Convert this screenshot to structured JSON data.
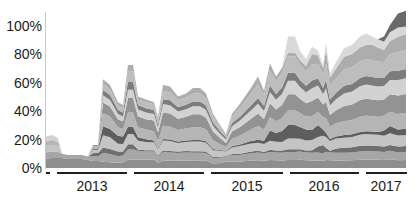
{
  "chart_data": {
    "type": "area",
    "stacked": true,
    "title": "",
    "xlabel": "",
    "ylabel": "",
    "ylim": [
      0,
      110
    ],
    "grid": false,
    "legend": null,
    "y_ticks": [
      "0%",
      "20%",
      "40%",
      "60%",
      "80%",
      "100%"
    ],
    "y_tick_values": [
      0,
      20,
      40,
      60,
      80,
      100
    ],
    "x_groups": [
      {
        "label": "",
        "x_start": 46,
        "x_end": 50
      },
      {
        "label": "2013",
        "x_start": 57,
        "x_end": 127
      },
      {
        "label": "2014",
        "x_start": 134,
        "x_end": 204
      },
      {
        "label": "2015",
        "x_start": 211,
        "x_end": 283
      },
      {
        "label": "2016",
        "x_start": 290,
        "x_end": 359
      },
      {
        "label": "2017",
        "x_start": 366,
        "x_end": 407
      }
    ],
    "x_pixels": [
      46,
      52,
      58,
      62,
      68,
      75,
      82,
      88,
      93,
      98,
      103,
      110,
      118,
      123,
      128,
      133,
      138,
      146,
      154,
      158,
      163,
      170,
      178,
      186,
      193,
      200,
      206,
      213,
      220,
      226,
      232,
      240,
      250,
      258,
      264,
      270,
      276,
      282,
      288,
      295,
      300,
      306,
      312,
      318,
      323,
      326,
      330,
      336,
      344,
      352,
      360,
      366,
      372,
      378,
      384,
      390,
      398,
      406
    ],
    "total": [
      22,
      23,
      21,
      10,
      9,
      9,
      9,
      8,
      16,
      16,
      62,
      58,
      46,
      44,
      72,
      72,
      50,
      48,
      46,
      36,
      58,
      57,
      50,
      52,
      56,
      56,
      52,
      38,
      30,
      24,
      38,
      45,
      55,
      64,
      54,
      73,
      64,
      70,
      92,
      92,
      82,
      76,
      85,
      82,
      72,
      88,
      66,
      74,
      84,
      86,
      92,
      94,
      92,
      90,
      92,
      100,
      108,
      110
    ],
    "series": [
      {
        "name": "layer-1",
        "color": "#8e8e8e",
        "share": [
          0.3,
          0.3,
          0.33,
          0.7,
          0.7,
          0.7,
          0.7,
          0.7,
          0.3,
          0.3,
          0.07,
          0.07,
          0.08,
          0.09,
          0.08,
          0.08,
          0.12,
          0.12,
          0.13,
          0.1,
          0.09,
          0.09,
          0.1,
          0.1,
          0.09,
          0.09,
          0.1,
          0.08,
          0.12,
          0.2,
          0.12,
          0.1,
          0.09,
          0.08,
          0.09,
          0.07,
          0.08,
          0.07,
          0.06,
          0.06,
          0.07,
          0.07,
          0.06,
          0.06,
          0.07,
          0.06,
          0.08,
          0.07,
          0.06,
          0.06,
          0.06,
          0.06,
          0.06,
          0.06,
          0.06,
          0.06,
          0.05,
          0.05
        ]
      },
      {
        "name": "layer-2",
        "color": "#a6a6a6",
        "share": [
          0.2,
          0.2,
          0.2,
          0.3,
          0.3,
          0.3,
          0.3,
          0.3,
          0.2,
          0.2,
          0.1,
          0.1,
          0.1,
          0.11,
          0.1,
          0.1,
          0.12,
          0.12,
          0.12,
          0.12,
          0.1,
          0.1,
          0.11,
          0.11,
          0.1,
          0.1,
          0.1,
          0.1,
          0.12,
          0.14,
          0.12,
          0.1,
          0.09,
          0.08,
          0.09,
          0.07,
          0.08,
          0.07,
          0.06,
          0.06,
          0.07,
          0.07,
          0.06,
          0.07,
          0.07,
          0.06,
          0.08,
          0.07,
          0.06,
          0.06,
          0.06,
          0.06,
          0.06,
          0.06,
          0.06,
          0.06,
          0.05,
          0.05
        ]
      },
      {
        "name": "layer-3",
        "color": "#6f6f6f",
        "share": [
          0,
          0,
          0,
          0,
          0,
          0,
          0,
          0,
          0.15,
          0.15,
          0.06,
          0.06,
          0.07,
          0.06,
          0.05,
          0.05,
          0.02,
          0.02,
          0.02,
          0.02,
          0.02,
          0.02,
          0.02,
          0.02,
          0.02,
          0.02,
          0.02,
          0.02,
          0.02,
          0.02,
          0.02,
          0.02,
          0.02,
          0.02,
          0.02,
          0.02,
          0.02,
          0.02,
          0.02,
          0.02,
          0.02,
          0.02,
          0.02,
          0.05,
          0.08,
          0.03,
          0.02,
          0.04,
          0.04,
          0.04,
          0.04,
          0.04,
          0.04,
          0.04,
          0.04,
          0.04,
          0.04,
          0.04
        ]
      },
      {
        "name": "layer-4",
        "color": "#c4c4c4",
        "share": [
          0.2,
          0.2,
          0.2,
          0,
          0,
          0,
          0,
          0,
          0.15,
          0.15,
          0.14,
          0.14,
          0.12,
          0.12,
          0.1,
          0.1,
          0.12,
          0.12,
          0.12,
          0.12,
          0.12,
          0.12,
          0.12,
          0.12,
          0.12,
          0.12,
          0.12,
          0.12,
          0.14,
          0.14,
          0.12,
          0.12,
          0.1,
          0.08,
          0.1,
          0.08,
          0.09,
          0.08,
          0.08,
          0.08,
          0.09,
          0.09,
          0.08,
          0.08,
          0.09,
          0.08,
          0.1,
          0.09,
          0.08,
          0.08,
          0.08,
          0.08,
          0.08,
          0.08,
          0.08,
          0.08,
          0.07,
          0.07
        ]
      },
      {
        "name": "layer-5",
        "color": "#5e5e5e",
        "share": [
          0,
          0,
          0,
          0,
          0,
          0,
          0,
          0,
          0.05,
          0.05,
          0.1,
          0.1,
          0.12,
          0.12,
          0.07,
          0.07,
          0.05,
          0.04,
          0.03,
          0.02,
          0.02,
          0.02,
          0.02,
          0.02,
          0.02,
          0.02,
          0.02,
          0.02,
          0.02,
          0.02,
          0.02,
          0.02,
          0.03,
          0.03,
          0.04,
          0.09,
          0.09,
          0.1,
          0.1,
          0.1,
          0.1,
          0.1,
          0.08,
          0.1,
          0.06,
          0.03,
          0.02,
          0.02,
          0.02,
          0.02,
          0.02,
          0.02,
          0.02,
          0.02,
          0.04,
          0.05,
          0.04,
          0.04
        ]
      },
      {
        "name": "layer-6",
        "color": "#b5b5b5",
        "share": [
          0.15,
          0.15,
          0.14,
          0,
          0,
          0,
          0,
          0,
          0.1,
          0.1,
          0.15,
          0.15,
          0.13,
          0.12,
          0.14,
          0.14,
          0.14,
          0.14,
          0.14,
          0.14,
          0.16,
          0.16,
          0.16,
          0.16,
          0.16,
          0.16,
          0.16,
          0.16,
          0.14,
          0.12,
          0.14,
          0.14,
          0.14,
          0.14,
          0.14,
          0.12,
          0.12,
          0.12,
          0.11,
          0.11,
          0.12,
          0.12,
          0.11,
          0.11,
          0.12,
          0.11,
          0.13,
          0.12,
          0.11,
          0.11,
          0.11,
          0.11,
          0.11,
          0.11,
          0.11,
          0.1,
          0.1,
          0.1
        ]
      },
      {
        "name": "layer-7",
        "color": "#939393",
        "share": [
          0,
          0,
          0,
          0,
          0,
          0,
          0,
          0,
          0.05,
          0.05,
          0.12,
          0.12,
          0.12,
          0.12,
          0.14,
          0.14,
          0.15,
          0.15,
          0.16,
          0.16,
          0.16,
          0.16,
          0.16,
          0.16,
          0.16,
          0.16,
          0.16,
          0.16,
          0.14,
          0.12,
          0.13,
          0.13,
          0.13,
          0.13,
          0.13,
          0.12,
          0.12,
          0.12,
          0.12,
          0.12,
          0.12,
          0.12,
          0.12,
          0.12,
          0.12,
          0.12,
          0.12,
          0.12,
          0.12,
          0.12,
          0.12,
          0.12,
          0.12,
          0.12,
          0.12,
          0.12,
          0.12,
          0.12
        ]
      },
      {
        "name": "layer-8",
        "color": "#d2d2d2",
        "share": [
          0.15,
          0.15,
          0.13,
          0,
          0,
          0,
          0,
          0,
          0,
          0,
          0.08,
          0.08,
          0.08,
          0.08,
          0.08,
          0.08,
          0.1,
          0.1,
          0.1,
          0.1,
          0.1,
          0.1,
          0.1,
          0.1,
          0.1,
          0.1,
          0.1,
          0.1,
          0.1,
          0.1,
          0.1,
          0.1,
          0.1,
          0.1,
          0.1,
          0.1,
          0.1,
          0.1,
          0.1,
          0.1,
          0.1,
          0.1,
          0.1,
          0.1,
          0.1,
          0.1,
          0.1,
          0.1,
          0.1,
          0.1,
          0.1,
          0.1,
          0.1,
          0.1,
          0.1,
          0.1,
          0.1,
          0.1
        ]
      },
      {
        "name": "layer-9",
        "color": "#7c7c7c",
        "share": [
          0,
          0,
          0,
          0,
          0,
          0,
          0,
          0,
          0,
          0,
          0.06,
          0.06,
          0.06,
          0.06,
          0.08,
          0.08,
          0.06,
          0.06,
          0.06,
          0.06,
          0.06,
          0.06,
          0.06,
          0.06,
          0.06,
          0.06,
          0.06,
          0.06,
          0.06,
          0.06,
          0.06,
          0.06,
          0.06,
          0.06,
          0.06,
          0.06,
          0.06,
          0.06,
          0.06,
          0.06,
          0.06,
          0.06,
          0.06,
          0.06,
          0.06,
          0.06,
          0.06,
          0.06,
          0.06,
          0.06,
          0.06,
          0.06,
          0.06,
          0.06,
          0.06,
          0.06,
          0.06,
          0.06
        ]
      },
      {
        "name": "layer-10",
        "color": "#bdbdbd",
        "share": [
          0,
          0,
          0,
          0,
          0,
          0,
          0,
          0,
          0,
          0,
          0.07,
          0.07,
          0.07,
          0.07,
          0.1,
          0.1,
          0.08,
          0.09,
          0.09,
          0.12,
          0.1,
          0.1,
          0.1,
          0.1,
          0.1,
          0.1,
          0.1,
          0.12,
          0.1,
          0.1,
          0.12,
          0.14,
          0.14,
          0.14,
          0.13,
          0.13,
          0.13,
          0.13,
          0.12,
          0.12,
          0.13,
          0.13,
          0.13,
          0.12,
          0.13,
          0.12,
          0.14,
          0.13,
          0.13,
          0.13,
          0.12,
          0.12,
          0.12,
          0.12,
          0.12,
          0.12,
          0.12,
          0.12
        ]
      },
      {
        "name": "layer-11",
        "color": "#adadad",
        "share": [
          0,
          0,
          0,
          0,
          0,
          0,
          0,
          0,
          0,
          0,
          0.05,
          0.05,
          0.05,
          0.05,
          0.06,
          0.06,
          0.04,
          0.04,
          0.03,
          0.03,
          0.07,
          0.07,
          0.05,
          0.05,
          0.07,
          0.07,
          0.06,
          0.04,
          0.04,
          0.02,
          0.05,
          0.06,
          0.07,
          0.08,
          0.06,
          0.06,
          0.05,
          0.05,
          0.03,
          0.03,
          0.04,
          0.05,
          0.08,
          0.07,
          0.06,
          0.1,
          0.09,
          0.09,
          0.1,
          0.1,
          0.1,
          0.1,
          0.11,
          0.1,
          0.09,
          0.09,
          0.1,
          0.1
        ]
      },
      {
        "name": "layer-12",
        "color": "#d9d9d9",
        "share": [
          0,
          0,
          0,
          0,
          0,
          0,
          0,
          0,
          0,
          0,
          0,
          0,
          0,
          0,
          0,
          0,
          0,
          0,
          0,
          0,
          0,
          0,
          0,
          0,
          0,
          0,
          0,
          0,
          0,
          0,
          0,
          0,
          0,
          0,
          0,
          0,
          0,
          0,
          0.12,
          0.12,
          0.08,
          0.06,
          0.06,
          0.04,
          0.03,
          0.06,
          0.04,
          0.06,
          0.07,
          0.07,
          0.08,
          0.08,
          0.06,
          0.06,
          0.06,
          0.06,
          0.06,
          0.05
        ]
      },
      {
        "name": "layer-13",
        "color": "#6a6a6a",
        "share": [
          0,
          0,
          0,
          0,
          0,
          0,
          0,
          0,
          0,
          0,
          0,
          0,
          0,
          0,
          0,
          0,
          0,
          0,
          0,
          0,
          0,
          0,
          0,
          0,
          0,
          0,
          0,
          0,
          0,
          0,
          0,
          0,
          0,
          0,
          0,
          0,
          0,
          0,
          0,
          0,
          0,
          0,
          0,
          0,
          0,
          0,
          0,
          0,
          0,
          0,
          0,
          0,
          0,
          0,
          0.04,
          0.05,
          0.09,
          0.1
        ]
      }
    ]
  },
  "axes": {
    "y_tick_labels": [
      "0%",
      "20%",
      "40%",
      "60%",
      "80%",
      "100%"
    ],
    "year_labels": [
      "2013",
      "2014",
      "2015",
      "2016",
      "2017"
    ]
  }
}
